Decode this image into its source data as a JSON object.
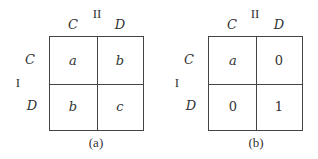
{
  "panels": [
    {
      "caption": "(a)",
      "col_player": "II",
      "row_player": "I",
      "col_labels": [
        "C",
        "D"
      ],
      "row_labels": [
        "C",
        "D"
      ],
      "cells": [
        [
          "a",
          "b"
        ],
        [
          "b",
          "c"
        ]
      ],
      "cells_italic": true
    },
    {
      "caption": "(b)",
      "col_player": "II",
      "row_player": "I",
      "col_labels": [
        "C",
        "D"
      ],
      "row_labels": [
        "C",
        "D"
      ],
      "cells": [
        [
          "a",
          "0"
        ],
        [
          "0",
          "1"
        ]
      ],
      "cells_italic": false
    }
  ]
}
